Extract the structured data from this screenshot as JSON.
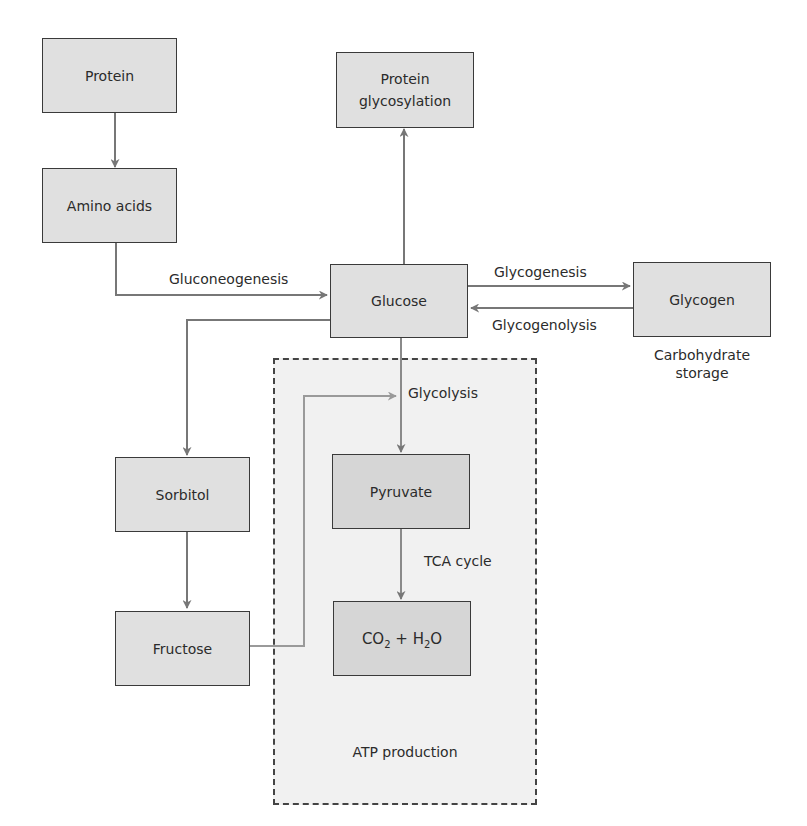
{
  "diagram": {
    "type": "metabolic-pathway-flowchart",
    "region": {
      "label": "ATP production"
    },
    "nodes": {
      "protein": "Protein",
      "amino_acids": "Amino acids",
      "protein_glycosylation_line1": "Protein",
      "protein_glycosylation_line2": "glycosylation",
      "glucose": "Glucose",
      "glycogen": "Glycogen",
      "sorbitol": "Sorbitol",
      "fructose": "Fructose",
      "pyruvate": "Pyruvate",
      "co2_h2o": {
        "a": "CO",
        "a_sub": "2",
        "plus": " + H",
        "b_sub": "2",
        "b": "O"
      }
    },
    "edge_labels": {
      "gluconeogenesis": "Gluconeogenesis",
      "glycogenesis": "Glycogenesis",
      "glycogenolysis": "Glycogenolysis",
      "glycolysis": "Glycolysis",
      "tca_cycle": "TCA cycle"
    },
    "annotations": {
      "carbohydrate_storage_line1": "Carbohydrate",
      "carbohydrate_storage_line2": "storage"
    },
    "edges": [
      {
        "from": "Protein",
        "to": "Amino acids"
      },
      {
        "from": "Amino acids",
        "to": "Glucose",
        "label": "Gluconeogenesis"
      },
      {
        "from": "Glucose",
        "to": "Protein glycosylation"
      },
      {
        "from": "Glucose",
        "to": "Glycogen",
        "label": "Glycogenesis"
      },
      {
        "from": "Glycogen",
        "to": "Glucose",
        "label": "Glycogenolysis"
      },
      {
        "from": "Glucose",
        "to": "Sorbitol"
      },
      {
        "from": "Sorbitol",
        "to": "Fructose"
      },
      {
        "from": "Glucose",
        "to": "Pyruvate",
        "label": "Glycolysis"
      },
      {
        "from": "Fructose",
        "to": "Glycolysis"
      },
      {
        "from": "Pyruvate",
        "to": "CO2 + H2O",
        "label": "TCA cycle"
      }
    ],
    "colors": {
      "node_fill": "#e0e0e0",
      "node_border": "#3a3a3a",
      "arrow": "#777777",
      "arrow_light": "#999999",
      "region_fill": "#f1f1f1"
    }
  }
}
